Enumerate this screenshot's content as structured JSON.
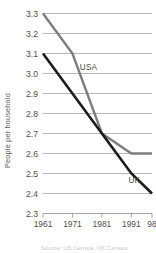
{
  "chart_data": {
    "type": "line",
    "title": "",
    "xlabel": "",
    "ylabel": "People per household",
    "ylim": [
      2.3,
      3.3
    ],
    "xlim": [
      1961,
      1998
    ],
    "grid": true,
    "legend_position": "inline-labels",
    "x": [
      1961,
      1971,
      1981,
      1991,
      1998
    ],
    "xtick_labels": [
      "1961",
      "1971",
      "1981",
      "1991",
      "98"
    ],
    "ytick_labels": [
      "2.3",
      "2.4",
      "2.5",
      "2.6",
      "2.7",
      "2.8",
      "2.9",
      "3.0",
      "3.1",
      "3.2",
      "3.3"
    ],
    "ytick_values": [
      2.3,
      2.4,
      2.5,
      2.6,
      2.7,
      2.8,
      2.9,
      3.0,
      3.1,
      3.2,
      3.3
    ],
    "series": [
      {
        "name": "USA",
        "color": "#7d7d7d",
        "values": [
          3.3,
          3.1,
          2.7,
          2.6,
          2.6
        ],
        "label_x": 1973.5,
        "label_y": 3.02
      },
      {
        "name": "UK",
        "color": "#1c1c1c",
        "values": [
          3.1,
          2.9,
          2.7,
          2.5,
          2.4
        ],
        "label_x": 1990.0,
        "label_y": 2.455
      }
    ],
    "source_note": "Source: US Census, UK Census"
  }
}
